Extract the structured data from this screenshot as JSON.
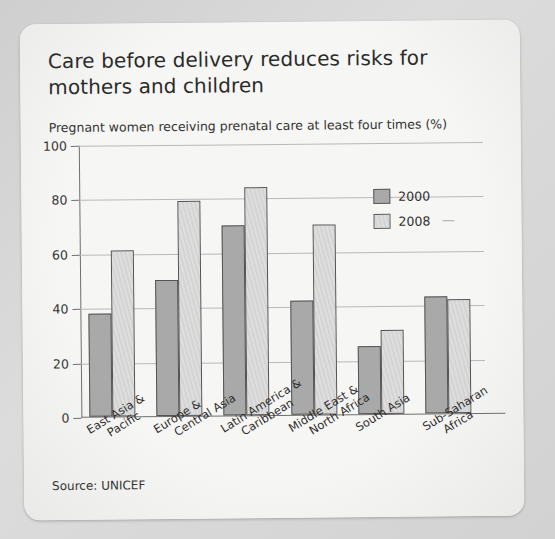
{
  "card": {
    "title": "Care before delivery reduces risks for mothers and children",
    "source": "Source: UNICEF"
  },
  "legend": {
    "position": "top-right",
    "items": [
      {
        "label": "2000",
        "color": "#a9a9a9",
        "icon": "legend-swatch-2000"
      },
      {
        "label": "2008",
        "color": "#dedede",
        "icon": "legend-swatch-2008"
      }
    ]
  },
  "chart_data": {
    "type": "bar",
    "title": "Care before delivery reduces risks for mothers and children",
    "subtitle": "Pregnant women receiving prenatal care at least four times (%)",
    "xlabel": "",
    "ylabel": "",
    "ylim": [
      0,
      100
    ],
    "yticks": [
      0,
      20,
      40,
      60,
      80,
      100
    ],
    "grid": true,
    "legend_position": "top-right",
    "categories": [
      "East Asia &\nPacific",
      "Europe &\nCentral Asia",
      "Latin America &\nCaribbean",
      "Middle East &\nNorth Africa",
      "South Asia",
      "Sub-Saharan\nAfrica"
    ],
    "series": [
      {
        "name": "2000",
        "color": "#a9a9a9",
        "values": [
          38,
          50,
          70,
          42,
          25,
          43
        ]
      },
      {
        "name": "2008",
        "color": "#dedede",
        "values": [
          61,
          79,
          84,
          70,
          31,
          42
        ]
      }
    ]
  }
}
